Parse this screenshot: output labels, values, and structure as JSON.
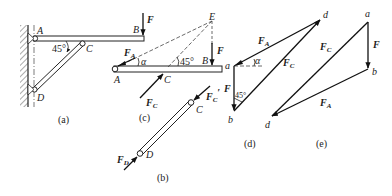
{
  "figures": {
    "a": {
      "caption": "(a)",
      "points": {
        "A": "A",
        "B": "B",
        "C": "C",
        "D": "D"
      },
      "angle": "45°",
      "force": "F"
    },
    "b": {
      "caption": "(b)",
      "points": {
        "C": "C",
        "D": "D"
      },
      "forces": {
        "FC_prime": "F",
        "FC_prime_sub": "C",
        "FC_prime_mark": "′",
        "FD": "F",
        "FD_sub": "D"
      }
    },
    "c": {
      "caption": "(c)",
      "points": {
        "A": "A",
        "B": "B",
        "C": "C",
        "E": "E"
      },
      "angles": {
        "alpha": "α",
        "forty_five": "45°"
      },
      "forces": {
        "F": "F",
        "FA": "F",
        "FA_sub": "A",
        "FC": "F",
        "FC_sub": "C"
      }
    },
    "d": {
      "caption": "(d)",
      "points": {
        "a": "a",
        "b": "b",
        "d": "d"
      },
      "angles": {
        "alpha": "α",
        "forty_five": "45°"
      },
      "forces": {
        "F": "F",
        "FA": "F",
        "FA_sub": "A",
        "FC": "F",
        "FC_sub": "C"
      }
    },
    "e": {
      "caption": "(e)",
      "points": {
        "a": "a",
        "b": "b",
        "d": "d"
      },
      "forces": {
        "F": "F",
        "FA": "F",
        "FA_sub": "A",
        "FC": "F",
        "FC_sub": "C"
      }
    }
  }
}
